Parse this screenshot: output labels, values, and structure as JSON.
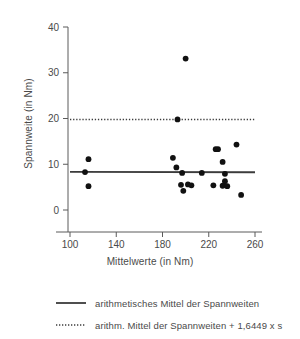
{
  "chart_data": {
    "type": "scatter",
    "title": "",
    "xlabel": "Mittelwerte (in Nm)",
    "ylabel": "Spannweite (in Nm)",
    "xlim": [
      100,
      260
    ],
    "ylim": [
      0,
      40
    ],
    "xticks": [
      100,
      140,
      180,
      220,
      260
    ],
    "yticks": [
      0,
      10,
      20,
      30,
      40
    ],
    "xtick_labels": [
      "100",
      "140",
      "180",
      "220",
      "260"
    ],
    "ytick_labels": [
      "0",
      "10",
      "20",
      "30",
      "40"
    ],
    "grid": false,
    "legend_position": "bottom",
    "marker_color": "#111111",
    "line_color": "#3c3c3c",
    "axis_color": "#5a5a5a",
    "points": [
      {
        "x": 113,
        "y": 8.3
      },
      {
        "x": 116,
        "y": 11.1
      },
      {
        "x": 116,
        "y": 5.2
      },
      {
        "x": 189,
        "y": 11.4
      },
      {
        "x": 192,
        "y": 9.3
      },
      {
        "x": 193,
        "y": 19.8
      },
      {
        "x": 197,
        "y": 8.1
      },
      {
        "x": 196,
        "y": 5.5
      },
      {
        "x": 198,
        "y": 4.2
      },
      {
        "x": 200,
        "y": 33.1
      },
      {
        "x": 202,
        "y": 5.6
      },
      {
        "x": 205,
        "y": 5.4
      },
      {
        "x": 214,
        "y": 8.1
      },
      {
        "x": 224,
        "y": 5.4
      },
      {
        "x": 226,
        "y": 13.3
      },
      {
        "x": 228,
        "y": 13.3
      },
      {
        "x": 232,
        "y": 10.5
      },
      {
        "x": 234,
        "y": 7.9
      },
      {
        "x": 234,
        "y": 6.3
      },
      {
        "x": 232,
        "y": 5.3
      },
      {
        "x": 236,
        "y": 5.2
      },
      {
        "x": 244,
        "y": 14.3
      },
      {
        "x": 248,
        "y": 3.3
      }
    ],
    "reference_lines": [
      {
        "name": "arithmetic-mean",
        "style": "solid",
        "y_start": 8.35,
        "y_end": 8.25,
        "x_start": 100,
        "x_end": 260
      },
      {
        "name": "mean-plus-1.6449s",
        "style": "dotted",
        "y_start": 19.8,
        "y_end": 19.8,
        "x_start": 100,
        "x_end": 260
      }
    ],
    "legend": [
      {
        "style": "solid",
        "label": "arithmetisches Mittel der Spannweiten"
      },
      {
        "style": "dotted",
        "label": "arithm. Mittel der Spannweiten + 1,6449 x s"
      }
    ]
  }
}
